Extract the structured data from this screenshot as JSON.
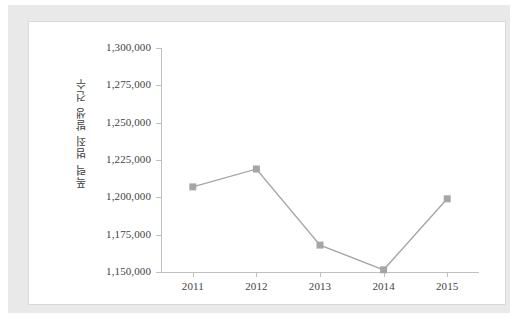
{
  "chart_data": {
    "type": "line",
    "title": "",
    "subtitle": "",
    "xlabel": "",
    "ylabel": "폭력 범죄 발생 건수",
    "categories": [
      "2011",
      "2012",
      "2013",
      "2014",
      "2015"
    ],
    "values": [
      1207000,
      1219000,
      1168000,
      1151500,
      1199000
    ],
    "series": [
      {
        "name": "폭력 범죄 발생 건수",
        "values": [
          1207000,
          1219000,
          1168000,
          1151500,
          1199000
        ]
      }
    ],
    "ylim": [
      1150000,
      1300000
    ],
    "ytick_values": [
      1150000,
      1175000,
      1200000,
      1225000,
      1250000,
      1275000,
      1300000
    ],
    "ytick_labels": [
      "1,150,000",
      "1,175,000",
      "1,200,000",
      "1,225,000",
      "1,250,000",
      "1,275,000",
      "1,300,000"
    ],
    "xtick_labels": [
      "2011",
      "2012",
      "2013",
      "2014",
      "2015"
    ],
    "grid": false,
    "legend": false,
    "legend_position": "none",
    "marker": "square",
    "line_color": "#a6a6a6",
    "marker_color": "#a6a6a6",
    "axis_color": "#bfbfbf",
    "text_color": "#3f3f3f",
    "plot_background": "#ffffff",
    "frame_color": "#e9e9e9"
  }
}
